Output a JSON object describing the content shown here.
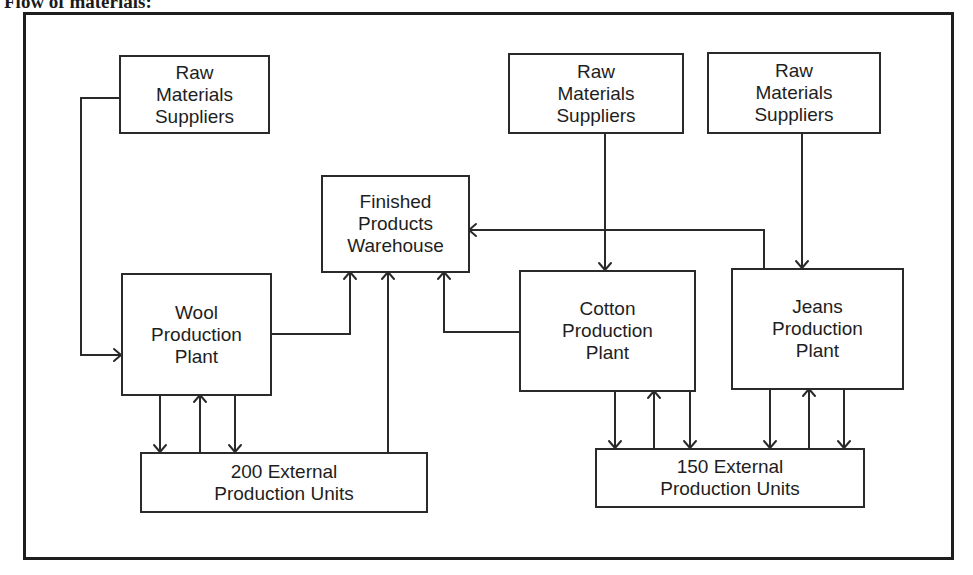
{
  "title": "Flow of materials:",
  "colors": {
    "line": "#2a2a2a",
    "frame": "#1e1e1e",
    "background": "#ffffff",
    "text": "#1e1e1e"
  },
  "nodes": {
    "rms_wool": {
      "lines": [
        "Raw",
        "Materials",
        "Suppliers"
      ]
    },
    "rms_cotton": {
      "lines": [
        "Raw",
        "Materials",
        "Suppliers"
      ]
    },
    "rms_jeans": {
      "lines": [
        "Raw",
        "Materials",
        "Suppliers"
      ]
    },
    "warehouse": {
      "lines": [
        "Finished",
        "Products",
        "Warehouse"
      ]
    },
    "wool_plant": {
      "lines": [
        "Wool",
        "Production",
        "Plant"
      ]
    },
    "cotton_plant": {
      "lines": [
        "Cotton",
        "Production",
        "Plant"
      ]
    },
    "jeans_plant": {
      "lines": [
        "Jeans",
        "Production",
        "Plant"
      ]
    },
    "ext_200": {
      "lines": [
        "200 External",
        "Production Units"
      ]
    },
    "ext_150": {
      "lines": [
        "150 External",
        "Production Units"
      ]
    }
  },
  "edges": [
    {
      "from": "Raw Materials Suppliers (left)",
      "to": "Wool Production Plant"
    },
    {
      "from": "Raw Materials Suppliers (center)",
      "to": "Cotton Production Plant"
    },
    {
      "from": "Raw Materials Suppliers (right)",
      "to": "Jeans Production Plant"
    },
    {
      "from": "Wool Production Plant",
      "to": "Finished Products Warehouse"
    },
    {
      "from": "200 External Production Units",
      "to": "Finished Products Warehouse"
    },
    {
      "from": "Cotton Production Plant",
      "to": "Finished Products Warehouse"
    },
    {
      "from": "Jeans Production Plant",
      "to": "Finished Products Warehouse"
    },
    {
      "from": "Wool Production Plant",
      "to": "200 External Production Units",
      "count": 2
    },
    {
      "from": "200 External Production Units",
      "to": "Wool Production Plant"
    },
    {
      "from": "Cotton Production Plant",
      "to": "150 External Production Units",
      "count": 2
    },
    {
      "from": "150 External Production Units",
      "to": "Cotton Production Plant"
    },
    {
      "from": "Jeans Production Plant",
      "to": "150 External Production Units",
      "count": 2
    },
    {
      "from": "150 External Production Units",
      "to": "Jeans Production Plant"
    }
  ]
}
